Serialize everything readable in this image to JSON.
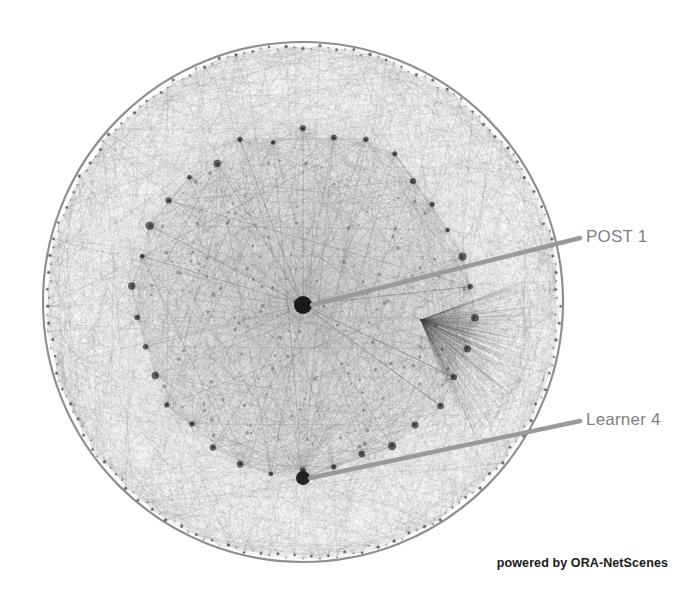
{
  "visualization": {
    "type": "network-graph",
    "renderer": "ORA-NetScenes",
    "layout": "circular-hairball",
    "background_color": "#ffffff",
    "edge_color": "#555555",
    "node_color": "#1a1a1a",
    "boundary_color": "#4a4a4a",
    "geometry": {
      "center_x": 303,
      "center_y": 302,
      "outer_radius": 260,
      "inner_ring_radius": 168,
      "hub_radius": 9
    },
    "counts": {
      "outer_ring_nodes": 190,
      "inner_ring_nodes": 34,
      "edge_count": 2600
    }
  },
  "nodes": [
    {
      "id": "post-1",
      "label": "POST 1",
      "x": 303,
      "y": 305,
      "radius": 9,
      "role": "hub",
      "color": "#141414"
    },
    {
      "id": "learner-4",
      "label": "Learner 4",
      "x": 303,
      "y": 478,
      "radius": 7,
      "role": "inner-ring",
      "color": "#1c1c1c"
    }
  ],
  "labels": {
    "post1": {
      "text": "POST 1",
      "color": "#808080",
      "leader_from_x": 312,
      "leader_from_y": 305,
      "leader_to_x": 580,
      "leader_to_y": 238
    },
    "learner4": {
      "text": "Learner 4",
      "color": "#808080",
      "leader_from_x": 310,
      "leader_from_y": 478,
      "leader_to_x": 580,
      "leader_to_y": 421
    }
  },
  "leader_line": {
    "color": "#9a9a9a",
    "width": 4.5
  },
  "watermark": {
    "text": "powered by ORA-NetScenes",
    "color": "#1a1a1a"
  }
}
